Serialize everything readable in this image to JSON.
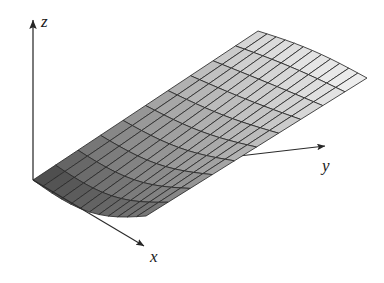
{
  "figure": {
    "kind": "3d-surface-plot",
    "background_color": "#ffffff",
    "mesh_line_color": "#2b2b2b",
    "axis_color": "#2a2a2a",
    "shade_near_color": "#3a3a3a",
    "shade_far_color": "#f2f2f2"
  },
  "axes": [
    {
      "name": "z",
      "label": "z",
      "direction": "up",
      "label_pos": [
        41,
        13
      ]
    },
    {
      "name": "x",
      "label": "x",
      "direction": "down-right",
      "label_pos": [
        150,
        248
      ]
    },
    {
      "name": "y",
      "label": "y",
      "direction": "right",
      "label_pos": [
        322,
        157
      ]
    }
  ],
  "chart_data": {
    "type": "surface",
    "title": "",
    "xlabel": "x",
    "ylabel": "y",
    "zlabel": "z",
    "grid": true,
    "legend": "none",
    "surface_equation": "z = y^2 (parabolic cylinder rising with y, flat along x)",
    "u_divisions": 12,
    "v_divisions": 10,
    "xlim": [
      0,
      1
    ],
    "ylim": [
      0,
      1
    ],
    "zlim": [
      0,
      1
    ],
    "shading": "grayscale, dark near origin to near-white at far edge",
    "origin_px": [
      33,
      180
    ],
    "corners_px": {
      "origin": [
        33,
        180
      ],
      "x_near_far": [
        146,
        216
      ],
      "y_far": [
        258,
        31
      ],
      "far_corner": [
        367,
        78
      ]
    }
  },
  "axis_geometry": {
    "z": {
      "from": [
        33,
        180
      ],
      "to": [
        33,
        20
      ]
    },
    "x": {
      "from": [
        33,
        180
      ],
      "to": [
        144,
        246
      ]
    },
    "y": {
      "from": [
        33,
        180
      ],
      "to": [
        325,
        146
      ]
    }
  }
}
